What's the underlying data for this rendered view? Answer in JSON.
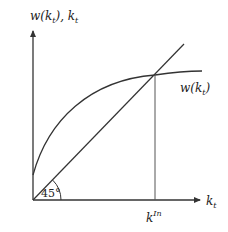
{
  "diagram": {
    "y_axis_label": {
      "main": "w(k",
      "sub": "t",
      "tail": "), k",
      "sub2": "t"
    },
    "x_axis_label": {
      "main": "k",
      "sub": "t"
    },
    "curve_label": {
      "main": "w(k",
      "sub": "t",
      "tail": ")"
    },
    "intersection_label": {
      "main": "k",
      "sup": "In"
    },
    "angle_label": "45°",
    "colors": {
      "line": "#333333",
      "background": "#ffffff"
    }
  }
}
